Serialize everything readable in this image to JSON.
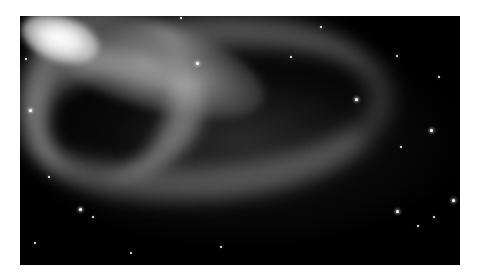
{
  "image": {
    "subject": "barred spiral galaxy",
    "alt": "Grayscale photograph of a barred spiral galaxy with a bright central core, a luminous bar, and sweeping spiral arms against a black starfield",
    "colors": {
      "background": "#ffffff",
      "space": "#000000",
      "core": "#ffffff",
      "arms": "#a8a8a8"
    }
  }
}
